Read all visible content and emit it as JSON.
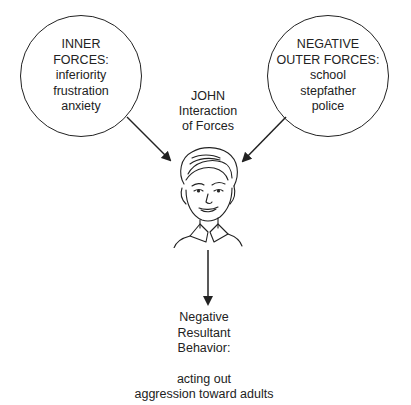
{
  "diagram": {
    "inner_forces": {
      "heading": [
        "INNER",
        "FORCES:"
      ],
      "items": [
        "inferiority",
        "frustration",
        "anxiety"
      ]
    },
    "outer_forces": {
      "heading": [
        "NEGATIVE",
        "OUTER FORCES:"
      ],
      "items": [
        "school",
        "stepfather",
        "police"
      ]
    },
    "center": {
      "name": "JOHN",
      "subtitle": [
        "Interaction",
        "of Forces"
      ],
      "icon": "boy-portrait-illustration"
    },
    "result": {
      "heading": [
        "Negative",
        "Resultant",
        "Behavior:"
      ],
      "items": [
        "acting out",
        "aggression toward adults"
      ]
    },
    "colors": {
      "stroke": "#222222",
      "background": "#ffffff"
    }
  }
}
